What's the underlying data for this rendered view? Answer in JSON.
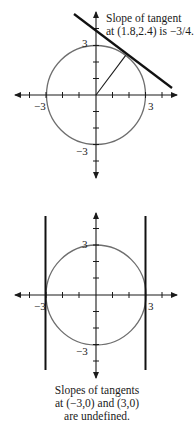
{
  "figures": [
    {
      "id": "top",
      "circle_radius": 3,
      "tangent_point": [
        1.8,
        2.4
      ],
      "tangent_slope": "-3/4",
      "caption": [
        "Slope of tangent",
        "at (1.8,2.4) is −3/4."
      ],
      "labels": {
        "y_top": "3",
        "x_left": "−3",
        "x_right": "3",
        "y_bottom": "−3"
      }
    },
    {
      "id": "bottom",
      "circle_radius": 3,
      "tangent_points": [
        [
          -3,
          0
        ],
        [
          3,
          0
        ]
      ],
      "tangent_slope": "undefined",
      "caption": [
        "Slopes of tangents",
        "at (−3,0) and (3,0)",
        "are undefined."
      ],
      "labels": {
        "y_top": "3",
        "x_left": "−3",
        "x_right": "3",
        "y_bottom": "−3"
      }
    }
  ],
  "colors": {
    "axis": "#1a1a1a",
    "circle": "#6e6e6e",
    "tangent": "#111111"
  }
}
